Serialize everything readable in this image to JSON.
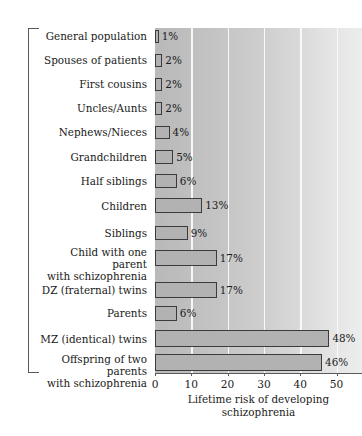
{
  "chart_data": {
    "type": "bar",
    "orientation": "horizontal",
    "title": "",
    "xlabel_line1": "Lifetime risk of developing",
    "xlabel_line2": "schizophrenia",
    "ylabel": "Relatives of Patients with Schizophrenia",
    "xlim": [
      0,
      57
    ],
    "xticks": [
      0,
      10,
      20,
      30,
      40,
      50
    ],
    "xtick_labels": [
      "0",
      "10",
      "20",
      "30",
      "40",
      "50"
    ],
    "grid": true,
    "grid_axis": "x",
    "legend": "none",
    "value_suffix": "%",
    "categories": [
      "General population",
      "Spouses of patients",
      "First cousins",
      "Uncles/Aunts",
      "Nephews/Nieces",
      "Grandchildren",
      "Half siblings",
      "Children",
      "Siblings",
      "Child with one parent with schizophrenia",
      "DZ (fraternal) twins",
      "Parents",
      "MZ (identical) twins",
      "Offspring of two parents with schizophrenia"
    ],
    "values": [
      1,
      2,
      2,
      2,
      4,
      5,
      6,
      13,
      9,
      17,
      17,
      6,
      48,
      46
    ],
    "value_labels": [
      "1%",
      "2%",
      "2%",
      "2%",
      "4%",
      "5%",
      "6%",
      "13%",
      "9%",
      "17%",
      "17%",
      "6%",
      "48%",
      "46%"
    ],
    "rows": [
      {
        "label_line1": "General population",
        "label_line2": "",
        "value": 1,
        "value_label": "1%"
      },
      {
        "label_line1": "Spouses of patients",
        "label_line2": "",
        "value": 2,
        "value_label": "2%"
      },
      {
        "label_line1": "First cousins",
        "label_line2": "",
        "value": 2,
        "value_label": "2%"
      },
      {
        "label_line1": "Uncles/Aunts",
        "label_line2": "",
        "value": 2,
        "value_label": "2%"
      },
      {
        "label_line1": "Nephews/Nieces",
        "label_line2": "",
        "value": 4,
        "value_label": "4%"
      },
      {
        "label_line1": "Grandchildren",
        "label_line2": "",
        "value": 5,
        "value_label": "5%"
      },
      {
        "label_line1": "Half siblings",
        "label_line2": "",
        "value": 6,
        "value_label": "6%"
      },
      {
        "label_line1": "Children",
        "label_line2": "",
        "value": 13,
        "value_label": "13%"
      },
      {
        "label_line1": "Siblings",
        "label_line2": "",
        "value": 9,
        "value_label": "9%"
      },
      {
        "label_line1": "Child with one parent",
        "label_line2": "with schizophrenia",
        "value": 17,
        "value_label": "17%"
      },
      {
        "label_line1": "DZ (fraternal) twins",
        "label_line2": "",
        "value": 17,
        "value_label": "17%"
      },
      {
        "label_line1": "Parents",
        "label_line2": "",
        "value": 6,
        "value_label": "6%"
      },
      {
        "label_line1": "MZ (identical) twins",
        "label_line2": "",
        "value": 48,
        "value_label": "48%"
      },
      {
        "label_line1": "Offspring of two parents",
        "label_line2": "with schizophrenia",
        "value": 46,
        "value_label": "46%"
      }
    ],
    "colors": {
      "bar_fill": "#b2b2b2",
      "bar_border": "#3b3b3b",
      "plot_background_left": "#b9b9b9",
      "plot_background_right": "#ededed",
      "gridline": "#fbfbfb",
      "axis": "#5a5a5a",
      "text": "#1a1a1a"
    }
  }
}
